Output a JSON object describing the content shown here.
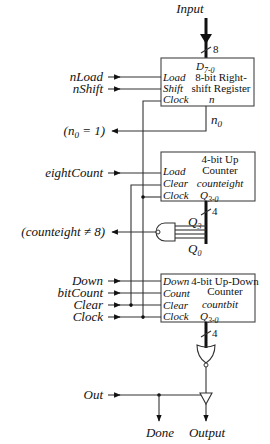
{
  "inputs": {
    "input": "Input",
    "input_width": "8",
    "nLoad": "nLoad",
    "nShift": "nShift",
    "eightCount": "eightCount",
    "down": "Down",
    "bitCount": "bitCount",
    "clear": "Clear",
    "clock": "Clock",
    "out": "Out"
  },
  "outputs": {
    "n0_eq_1": "(n0 = 1)",
    "counteight_ne_8": "(counteight ≠ 8)",
    "done": "Done",
    "output": "Output"
  },
  "register": {
    "title_line1": "8-bit Right-",
    "title_line2": "shift Register",
    "name": "n",
    "data_port": "D7-0",
    "ports": [
      "Load",
      "Shift",
      "Clock"
    ],
    "out_port": "n0"
  },
  "counteight": {
    "title_line1": "4-bit Up",
    "title_line2": "Counter",
    "name": "counteight",
    "ports": [
      "Load",
      "Clear",
      "Clock"
    ],
    "out_port": "Q3-0",
    "bus_width": "4",
    "bit_hi": "Q3",
    "bit_lo": "Q0"
  },
  "countbit": {
    "title_line1": "4-bit Up-Down",
    "title_line2": "Counter",
    "name": "countbit",
    "ports": [
      "Down",
      "Count",
      "Clear",
      "Clock"
    ],
    "out_port": "Q3-0",
    "bus_width": "4"
  }
}
